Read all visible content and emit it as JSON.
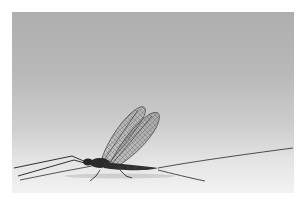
{
  "image": {
    "subject": "mayfly",
    "description": "Side view of a mayfly resting on a pale surface with upright translucent veined wings and long tail filaments",
    "background": "gray-to-white gradient studio backdrop"
  },
  "colors": {
    "background_top": "#aeaeae",
    "background_bottom": "#f2f2f2",
    "frame": "#ffffff",
    "body": "#2a2a2a",
    "wing": "#6a6a6a"
  }
}
